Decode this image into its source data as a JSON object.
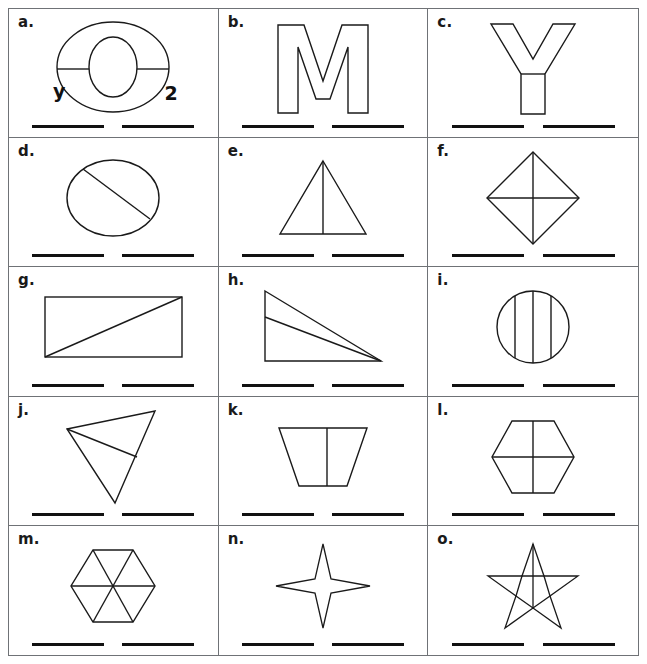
{
  "worksheet": {
    "title": "Shapes and Lines of Division Worksheet",
    "rows": 5,
    "columns": 3,
    "answer_lines_per_cell": 2,
    "border_color": "#6f7276",
    "ink_color": "#1a1a1a",
    "line_color": "#111111",
    "background": "#ffffff"
  },
  "cells": [
    {
      "id": "a",
      "label": "a.",
      "shape_name": "block-letter-o",
      "shape_description": "Outlined block capital letter O with a horizontal line across the middle",
      "extra_labels": [
        {
          "text": "y",
          "position": "left"
        },
        {
          "text": "2",
          "position": "right"
        }
      ]
    },
    {
      "id": "b",
      "label": "b.",
      "shape_name": "block-letter-m",
      "shape_description": "Outlined block capital letter M",
      "extra_labels": []
    },
    {
      "id": "c",
      "label": "c.",
      "shape_name": "block-letter-y",
      "shape_description": "Outlined block capital letter Y with a horizontal line separating the stem",
      "extra_labels": []
    },
    {
      "id": "d",
      "label": "d.",
      "shape_name": "ellipse-with-diagonal-chord",
      "shape_description": "Oval with a single diagonal chord from upper-left to lower-right",
      "extra_labels": []
    },
    {
      "id": "e",
      "label": "e.",
      "shape_name": "triangle-with-vertical-median",
      "shape_description": "Isosceles triangle with a vertical line from apex to base",
      "extra_labels": []
    },
    {
      "id": "f",
      "label": "f.",
      "shape_name": "rhombus-with-both-diagonals",
      "shape_description": "Diamond with horizontal and vertical diagonals drawn",
      "extra_labels": []
    },
    {
      "id": "g",
      "label": "g.",
      "shape_name": "rectangle-with-diagonal",
      "shape_description": "Rectangle with a diagonal from bottom-left to top-right",
      "extra_labels": []
    },
    {
      "id": "h",
      "label": "h.",
      "shape_name": "right-triangle-with-cevian",
      "shape_description": "Right triangle with a line from the right vertex to a point on the vertical leg",
      "extra_labels": []
    },
    {
      "id": "i",
      "label": "i.",
      "shape_name": "circle-with-three-vertical-chords",
      "shape_description": "Circle divided by three vertical lines",
      "extra_labels": []
    },
    {
      "id": "j",
      "label": "j.",
      "shape_name": "scalene-triangle-with-cevian",
      "shape_description": "Scalene triangle with a line from the left vertex to the right side",
      "extra_labels": []
    },
    {
      "id": "k",
      "label": "k.",
      "shape_name": "trapezoid-with-vertical-line",
      "shape_description": "Trapezoid with a wider top and a vertical dividing line",
      "extra_labels": []
    },
    {
      "id": "l",
      "label": "l.",
      "shape_name": "hexagon-with-cross",
      "shape_description": "Hexagon divided by a vertical and a horizontal line",
      "extra_labels": []
    },
    {
      "id": "m",
      "label": "m.",
      "shape_name": "hexagon-with-six-triangles",
      "shape_description": "Hexagon divided into six triangles by three main diagonals",
      "extra_labels": []
    },
    {
      "id": "n",
      "label": "n.",
      "shape_name": "four-pointed-star",
      "shape_description": "Concave four-pointed star",
      "extra_labels": []
    },
    {
      "id": "o",
      "label": "o.",
      "shape_name": "five-pointed-star-with-pentagon",
      "shape_description": "Five-pointed star with inner pentagon outline and a vertical line",
      "extra_labels": []
    }
  ]
}
